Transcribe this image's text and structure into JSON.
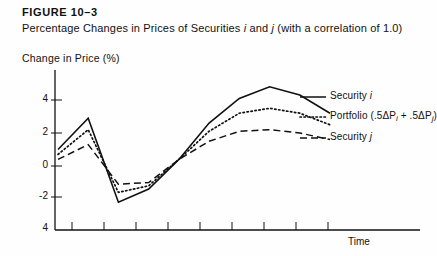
{
  "figure": {
    "label": "FIGURE 10–3",
    "subtitle_part1": "Percentage Changes in Prices of Securities ",
    "sec_i": "i",
    "subtitle_mid": " and ",
    "sec_j": "j",
    "subtitle_part2": " (with a correlation of 1.0)",
    "y_axis_title": "Change in Price (%)",
    "x_axis_title": "Time"
  },
  "legend": {
    "items": [
      {
        "label_pre": "Security ",
        "sym": "i",
        "label_post": "",
        "style": "solid"
      },
      {
        "label_pre": "Portfolio (.5ΔP",
        "sym": "i",
        "label_post": " + .5ΔP",
        "sym2": "j",
        "label_end": ")",
        "style": "dotted"
      },
      {
        "label_pre": "Security ",
        "sym": "j",
        "label_post": "",
        "style": "dashed"
      }
    ]
  },
  "chart_data": {
    "type": "line",
    "title": "Percentage Changes in Prices of Securities i and j (with a correlation of 1.0)",
    "xlabel": "Time",
    "ylabel": "Change in Price (%)",
    "ylim": [
      -4,
      5
    ],
    "yticks": [
      4,
      2,
      0,
      -2,
      -4
    ],
    "ytick_labels": [
      "4",
      "2",
      "0",
      "-2",
      "4"
    ],
    "xticks": 9,
    "xtick_labels": [],
    "grid": false,
    "legend_position": "right",
    "x": [
      0,
      1,
      2,
      3,
      4,
      5,
      6,
      7,
      8,
      9
    ],
    "series": [
      {
        "name": "Security i",
        "style": "solid",
        "values": [
          1.0,
          2.9,
          -2.2,
          -1.4,
          0.4,
          2.6,
          4.1,
          4.8,
          4.3,
          3.2
        ]
      },
      {
        "name": "Portfolio (.5ΔPi + .5ΔPj)",
        "style": "dotted",
        "values": [
          0.7,
          2.2,
          -1.6,
          -1.2,
          0.4,
          2.1,
          3.2,
          3.5,
          3.2,
          2.5
        ]
      },
      {
        "name": "Security j",
        "style": "dashed",
        "values": [
          0.4,
          1.3,
          -1.1,
          -1.0,
          0.4,
          1.5,
          2.1,
          2.2,
          2.0,
          1.6
        ]
      }
    ]
  },
  "colors": {
    "ink": "#111111",
    "paper": "#fefefe"
  }
}
